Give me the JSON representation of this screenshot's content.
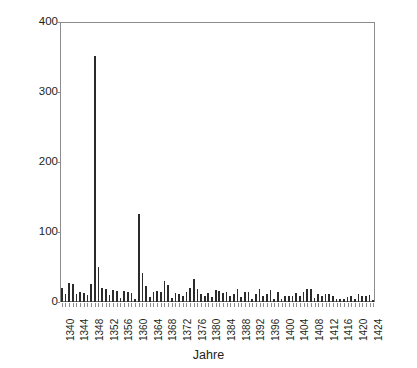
{
  "chart_data": {
    "type": "bar",
    "title": "",
    "subtitle": "",
    "xlabel": "Jahre",
    "ylabel": "Testamente",
    "xlim": [
      1339.5,
      1425.5
    ],
    "ylim": [
      0,
      400
    ],
    "y_ticks": [
      0,
      100,
      200,
      300,
      400
    ],
    "x_ticks": [
      1340,
      1344,
      1348,
      1352,
      1356,
      1360,
      1364,
      1368,
      1372,
      1376,
      1380,
      1384,
      1388,
      1392,
      1396,
      1400,
      1404,
      1408,
      1412,
      1416,
      1420,
      1424
    ],
    "x_tick_labels": [
      "1340",
      "1344",
      "1348",
      "1352",
      "1356",
      "1360",
      "1364",
      "1368",
      "1372",
      "1376",
      "1380",
      "1384",
      "1388",
      "1392",
      "1396",
      "1400",
      "1404",
      "1408",
      "1412",
      "1416",
      "1420",
      "1424"
    ],
    "grid": false,
    "legend": null,
    "bar_color": "#2b2b2b",
    "categories": [
      1340,
      1341,
      1342,
      1343,
      1344,
      1345,
      1346,
      1347,
      1348,
      1349,
      1350,
      1351,
      1352,
      1353,
      1354,
      1355,
      1356,
      1357,
      1358,
      1359,
      1360,
      1361,
      1362,
      1363,
      1364,
      1365,
      1366,
      1367,
      1368,
      1369,
      1370,
      1371,
      1372,
      1373,
      1374,
      1375,
      1376,
      1377,
      1378,
      1379,
      1380,
      1381,
      1382,
      1383,
      1384,
      1385,
      1386,
      1387,
      1388,
      1389,
      1390,
      1391,
      1392,
      1393,
      1394,
      1395,
      1396,
      1397,
      1398,
      1399,
      1400,
      1401,
      1402,
      1403,
      1404,
      1405,
      1406,
      1407,
      1408,
      1409,
      1410,
      1411,
      1412,
      1413,
      1414,
      1415,
      1416,
      1417,
      1418,
      1419,
      1420,
      1421,
      1422,
      1423,
      1424,
      1425
    ],
    "values": [
      20,
      12,
      27,
      26,
      12,
      14,
      13,
      10,
      26,
      352,
      50,
      20,
      18,
      10,
      17,
      16,
      6,
      16,
      15,
      13,
      4,
      126,
      42,
      23,
      7,
      15,
      16,
      14,
      30,
      24,
      6,
      13,
      12,
      9,
      14,
      20,
      33,
      18,
      11,
      8,
      13,
      7,
      17,
      16,
      13,
      15,
      8,
      12,
      18,
      7,
      15,
      15,
      5,
      12,
      18,
      8,
      12,
      17,
      5,
      15,
      4,
      9,
      9,
      9,
      13,
      8,
      14,
      18,
      19,
      6,
      11,
      9,
      12,
      11,
      9,
      4,
      5,
      5,
      7,
      9,
      5,
      12,
      8,
      9,
      10,
      3
    ],
    "annotations": [
      {
        "year": 1349,
        "value": 352,
        "note": "peak"
      },
      {
        "year": 1361,
        "value": 126,
        "note": "secondary peak"
      }
    ]
  },
  "axes": {
    "y_title": "Testamente",
    "x_title": "Jahre"
  }
}
